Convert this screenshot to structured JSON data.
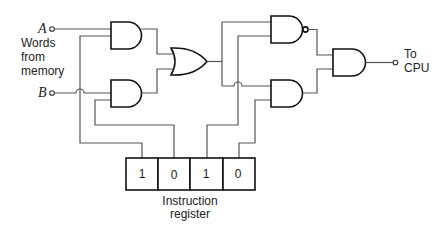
{
  "diagram": {
    "inputs": [
      {
        "id": "A",
        "label": "A"
      },
      {
        "id": "B",
        "label": "B"
      }
    ],
    "input_group_label": [
      "Words",
      "from",
      "memory"
    ],
    "output_label": [
      "To",
      "CPU"
    ],
    "register": {
      "label": [
        "Instruction",
        "register"
      ],
      "bits": [
        "1",
        "0",
        "1",
        "0"
      ]
    },
    "gates": [
      {
        "id": "and-a",
        "type": "AND"
      },
      {
        "id": "and-b",
        "type": "AND"
      },
      {
        "id": "or-1",
        "type": "OR"
      },
      {
        "id": "nand-1",
        "type": "NAND"
      },
      {
        "id": "and-2",
        "type": "AND"
      },
      {
        "id": "and-out",
        "type": "AND"
      }
    ]
  }
}
